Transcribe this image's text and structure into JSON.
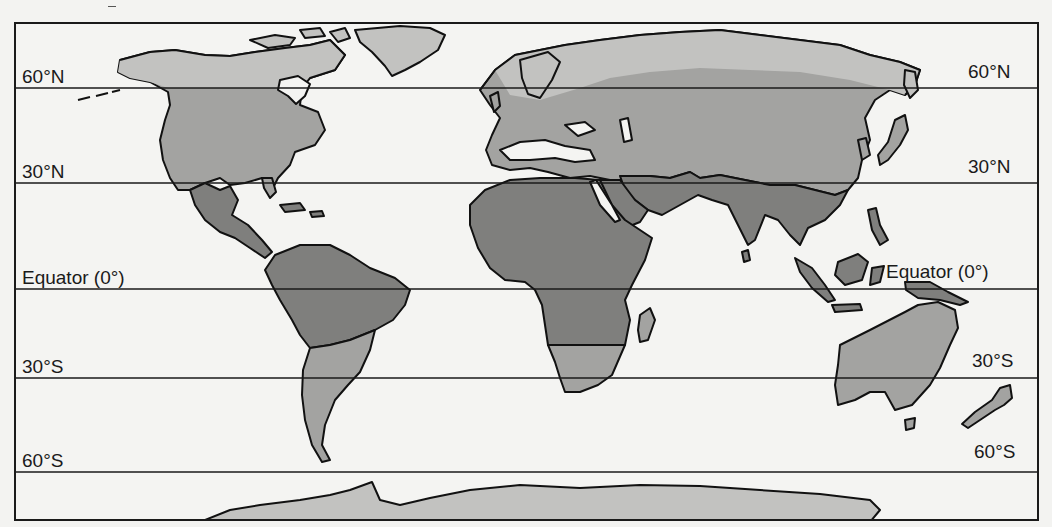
{
  "map": {
    "type": "world-latitude-zones",
    "colors": {
      "ocean": "#f4f4f2",
      "land_high_latitude": "#c2c2c0",
      "land_mid_latitude": "#a3a3a1",
      "land_tropical": "#7f7f7d",
      "outline": "#111111",
      "grid_line": "#1a1a1a"
    },
    "latitude_lines": [
      {
        "id": "60N",
        "label_left": "60°N",
        "label_right": "60°N",
        "y": 88
      },
      {
        "id": "30N",
        "label_left": "30°N",
        "label_right": "30°N",
        "y": 183
      },
      {
        "id": "eq",
        "label_left": "Equator (0°)",
        "label_right": "Equator (0°)",
        "y": 289
      },
      {
        "id": "30S",
        "label_left": "30°S",
        "label_right": "30°S",
        "y": 378
      },
      {
        "id": "60S",
        "label_left": "60°S",
        "label_right": "60°S",
        "y": 472
      }
    ]
  }
}
